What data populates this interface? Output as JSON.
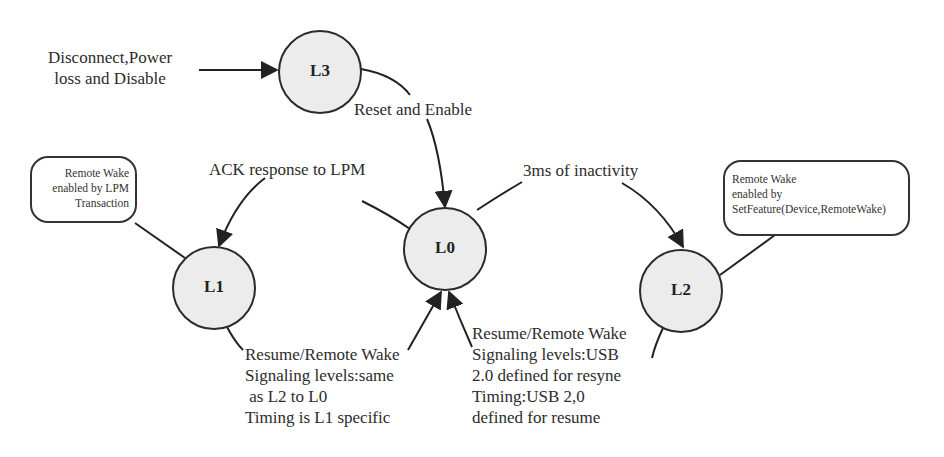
{
  "diagram": {
    "type": "state-machine",
    "colors": {
      "node_fill": "#ececec",
      "stroke": "#2b2b2b",
      "background": "#ffffff"
    },
    "nodes": [
      {
        "id": "L3",
        "label": "L3",
        "cx": 320,
        "cy": 72,
        "r": 41
      },
      {
        "id": "L0",
        "label": "L0",
        "cx": 445,
        "cy": 249,
        "r": 41
      },
      {
        "id": "L1",
        "label": "L1",
        "cx": 214,
        "cy": 288,
        "r": 41
      },
      {
        "id": "L2",
        "label": "L2",
        "cx": 681,
        "cy": 291,
        "r": 41
      }
    ],
    "transitions": {
      "to_L3": "Disconnect,Power\nloss and Disable",
      "L3_to_L0": "Reset and Enable",
      "L0_to_L1": "ACK response to LPM",
      "L0_to_L2": "3ms of inactivity",
      "L1_to_L0": "Resume/Remote Wake\nSignaling levels:same\n as L2 to L0\nTiming is L1 specific",
      "L2_to_L0": "Resume/Remote Wake\nSignaling levels:USB\n2.0 defined for resyne\nTiming:USB 2,0\ndefined for resume"
    },
    "callouts": {
      "L1_note": "Remote Wake\nenabled by LPM\nTransaction",
      "L2_note": "Remote Wake\nenabled by\nSetFeature(Device,RemoteWake)"
    }
  }
}
